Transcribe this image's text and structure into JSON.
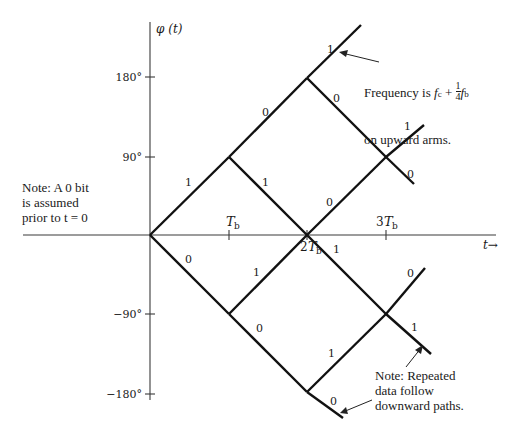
{
  "figure": {
    "y_axis_label": "φ (t)",
    "x_axis_label": "t→",
    "y_ticks": [
      {
        "label": "180°",
        "value": 180
      },
      {
        "label": "90°",
        "value": 90
      },
      {
        "label": "−90°",
        "value": -90
      },
      {
        "label": "−180°",
        "value": -180
      }
    ],
    "x_ticks": [
      {
        "label": "T",
        "sub": "b",
        "mult": "",
        "value": 1
      },
      {
        "label": "T",
        "sub": "b",
        "mult": "2",
        "value": 2
      },
      {
        "label": "T",
        "sub": "b",
        "mult": "3",
        "value": 3
      }
    ],
    "notes": {
      "left": "Note: A 0 bit\nis assumed\nprior to t = 0",
      "frequency_line1": "Frequency is ",
      "frequency_fc": "f",
      "frequency_fc_sub": "c",
      "frequency_plus": " + ",
      "frequency_num": "1",
      "frequency_den": "4",
      "frequency_fb": "f",
      "frequency_fb_sub": "b",
      "frequency_line2": "on upward arms.",
      "repeated": "Note: Repeated\ndata follow\ndownward paths."
    },
    "branch_labels": [
      {
        "id": "O-A",
        "bit": "1"
      },
      {
        "id": "O-E",
        "bit": "0"
      },
      {
        "id": "A-B",
        "bit": "0"
      },
      {
        "id": "A-C",
        "bit": "1"
      },
      {
        "id": "E-C",
        "bit": "1"
      },
      {
        "id": "E-F",
        "bit": "0"
      },
      {
        "id": "B-up",
        "bit": "1"
      },
      {
        "id": "B-D",
        "bit": "0"
      },
      {
        "id": "C-D",
        "bit": "0"
      },
      {
        "id": "C-G",
        "bit": "1"
      },
      {
        "id": "F-G",
        "bit": "1"
      },
      {
        "id": "F-down",
        "bit": "0"
      },
      {
        "id": "D-up",
        "bit": "1"
      },
      {
        "id": "D-down",
        "bit": "0"
      },
      {
        "id": "G-up",
        "bit": "0"
      },
      {
        "id": "G-down",
        "bit": "1"
      }
    ]
  }
}
